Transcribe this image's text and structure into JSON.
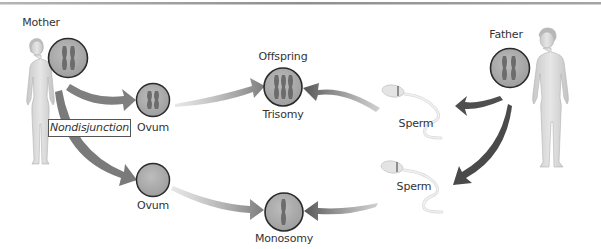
{
  "diagram": {
    "colors": {
      "circle_fill": "#a9a9a9",
      "circle_stroke": "#2a2a2a",
      "chromosome": "#6e6e6e",
      "arrow_light": "#8a8a8a",
      "arrow_dark": "#4a4a4a",
      "top_rule": "#9a9a9a",
      "figure": "#d9d9d9"
    },
    "labels": {
      "mother": "Mother",
      "father": "Father",
      "nondisjunction": "Nondisjunction",
      "ovum_top": "Ovum",
      "ovum_bottom": "Ovum",
      "offspring": "Offspring",
      "trisomy": "Trisomy",
      "monosomy": "Monosomy",
      "sperm_top": "Sperm",
      "sperm_bottom": "Sperm"
    },
    "nodes": [
      {
        "id": "mother-cell",
        "chromosomes": 2
      },
      {
        "id": "ovum-top",
        "chromosomes": 2
      },
      {
        "id": "ovum-bottom",
        "chromosomes": 0
      },
      {
        "id": "offspring-trisomy",
        "chromosomes": 3
      },
      {
        "id": "offspring-monosomy",
        "chromosomes": 1
      },
      {
        "id": "father-cell",
        "chromosomes": 2
      },
      {
        "id": "sperm-top",
        "chromosomes": 1
      },
      {
        "id": "sperm-bottom",
        "chromosomes": 1
      }
    ],
    "edges": [
      {
        "from": "mother-cell",
        "to": "ovum-top"
      },
      {
        "from": "mother-cell",
        "to": "ovum-bottom"
      },
      {
        "from": "ovum-top",
        "to": "offspring-trisomy"
      },
      {
        "from": "ovum-bottom",
        "to": "offspring-monosomy"
      },
      {
        "from": "father-cell",
        "to": "sperm-top"
      },
      {
        "from": "father-cell",
        "to": "sperm-bottom"
      },
      {
        "from": "sperm-top",
        "to": "offspring-trisomy"
      },
      {
        "from": "sperm-bottom",
        "to": "offspring-monosomy"
      }
    ]
  }
}
